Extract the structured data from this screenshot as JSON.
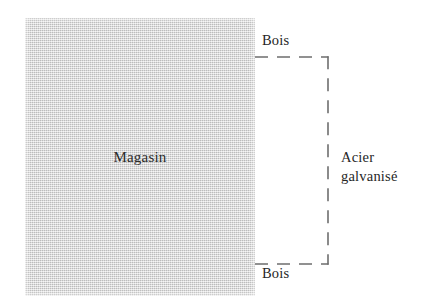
{
  "figure": {
    "type": "architectural-construction-diagram",
    "language": "fr",
    "background_color": "#ffffff",
    "building": {
      "label": "Magasin",
      "fill_color": "#d3d3d3",
      "texture": "halftone-dither",
      "x": 25,
      "y": 18,
      "width": 230,
      "height": 278
    },
    "annotations": {
      "top_material": "Bois",
      "bottom_material": "Bois",
      "side_material_line1": "Acier",
      "side_material_line2": "galvanisé"
    },
    "bracket": {
      "style": "dashed",
      "color": "#6e6e6e",
      "stroke_width": 1.6,
      "dash_pattern": "13 9",
      "top_y": 57,
      "bottom_y": 264,
      "left_x": 255,
      "right_x": 328
    }
  }
}
